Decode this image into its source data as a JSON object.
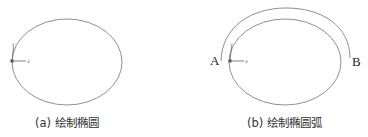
{
  "figures": [
    {
      "id": "a",
      "caption": "(a) 绘制椭圆",
      "ellipse": {
        "cx": 67,
        "cy": 62,
        "rx": 55,
        "ry": 43
      },
      "ucs_axes": {
        "origin": [
          12,
          61
        ],
        "x_label": "x",
        "y_label": "y"
      }
    },
    {
      "id": "b",
      "caption": "(b) 绘制椭圆弧",
      "ellipse": {
        "cx": 285,
        "cy": 62,
        "rx": 56,
        "ry": 43
      },
      "arc": {
        "start": [
          221,
          61
        ],
        "end": [
          350,
          58
        ],
        "peak_y": 8
      },
      "points": {
        "a_label": "A",
        "b_label": "B"
      },
      "ucs_axes": {
        "origin": [
          230,
          61
        ],
        "x_label": "x",
        "y_label": "y"
      }
    }
  ],
  "colors": {
    "line": "#8a8a8a",
    "axis": "#666666",
    "text": "#333333"
  }
}
